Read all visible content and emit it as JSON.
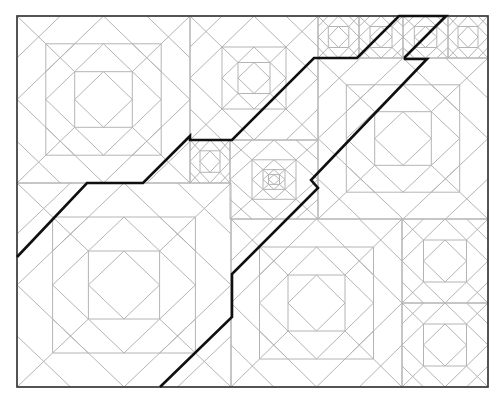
{
  "canvas": {
    "width": 503,
    "height": 400,
    "background": "#ffffff"
  },
  "figure": {
    "border": {
      "x": 17,
      "y": 16,
      "w": 471,
      "h": 371,
      "color": "#3c3c3c",
      "stroke_width": 1.7
    },
    "quilt": {
      "line_color": "#b4b4b4",
      "outline_color": "#9a9a9a",
      "line_width": 1,
      "cut_fraction": 0.25,
      "cut_min_size": 80,
      "blocks": [
        {
          "id": "top-left",
          "x": 17,
          "y": 16,
          "w": 173,
          "h": 167,
          "scales": [
            1,
            0.667,
            0.333
          ]
        },
        {
          "id": "top-middle",
          "x": 190,
          "y": 16,
          "w": 128,
          "h": 124,
          "scales": [
            1,
            0.5,
            0.25
          ]
        },
        {
          "id": "top-strip-1",
          "x": 318,
          "y": 16,
          "w": 41,
          "h": 42,
          "scales": [
            1,
            0.5
          ]
        },
        {
          "id": "top-strip-2",
          "x": 359,
          "y": 16,
          "w": 44,
          "h": 42,
          "scales": [
            1,
            0.5
          ]
        },
        {
          "id": "top-strip-3",
          "x": 403,
          "y": 16,
          "w": 45,
          "h": 42,
          "scales": [
            1,
            0.5
          ]
        },
        {
          "id": "top-strip-4",
          "x": 448,
          "y": 16,
          "w": 40,
          "h": 42,
          "scales": [
            1,
            0.5
          ]
        },
        {
          "id": "center-right",
          "x": 318,
          "y": 58,
          "w": 170,
          "h": 161,
          "scales": [
            1,
            0.667,
            0.333
          ]
        },
        {
          "id": "small-left",
          "x": 190,
          "y": 140,
          "w": 40,
          "h": 43,
          "scales": [
            1,
            0.5
          ]
        },
        {
          "id": "center-focus",
          "x": 230,
          "y": 140,
          "w": 88,
          "h": 79,
          "scales": [
            1,
            0.5,
            0.25,
            0.125
          ]
        },
        {
          "id": "bottom-left",
          "x": 17,
          "y": 183,
          "w": 214,
          "h": 204,
          "scales": [
            1,
            0.667,
            0.333
          ]
        },
        {
          "id": "bottom-middle",
          "x": 231,
          "y": 219,
          "w": 171,
          "h": 168,
          "scales": [
            1,
            0.667,
            0.333
          ]
        },
        {
          "id": "right-col-1",
          "x": 402,
          "y": 219,
          "w": 86,
          "h": 84,
          "scales": [
            1,
            0.5
          ]
        },
        {
          "id": "right-col-2",
          "x": 402,
          "y": 303,
          "w": 86,
          "h": 84,
          "scales": [
            1,
            0.5
          ]
        }
      ]
    },
    "zigzag_path": {
      "color": "#101010",
      "stroke_width": 2.6,
      "points": [
        [
          17,
          257
        ],
        [
          87,
          183
        ],
        [
          143,
          183
        ],
        [
          190,
          136
        ],
        [
          190,
          140
        ],
        [
          232,
          140
        ],
        [
          314,
          58
        ],
        [
          357,
          58
        ],
        [
          399,
          16
        ],
        [
          446,
          16
        ],
        [
          405,
          57
        ],
        [
          405,
          59
        ],
        [
          427,
          59
        ],
        [
          311,
          180
        ],
        [
          318,
          188
        ],
        [
          232,
          274
        ],
        [
          232,
          317
        ],
        [
          160,
          387
        ]
      ]
    }
  }
}
